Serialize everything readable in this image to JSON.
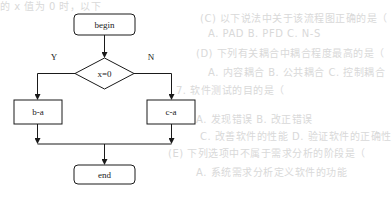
{
  "background_bleed_text": [
    {
      "text": "的 x 值为 0 时，以下",
      "x": 0,
      "y": -2
    },
    {
      "text": "(C) 以下说法中关于该流程图正确的是（",
      "x": 200,
      "y": 10
    },
    {
      "text": "A. PAD        B. PFD        C. N-S",
      "x": 208,
      "y": 28
    },
    {
      "text": "(D) 下列有关耦合中耦合程度最高的是（",
      "x": 196,
      "y": 45
    },
    {
      "text": "A. 内容耦合        B. 公共耦合    C. 控制耦合",
      "x": 208,
      "y": 64
    },
    {
      "text": "7. 软件测试的目的是（",
      "x": 176,
      "y": 82
    },
    {
      "text": "A. 发现错误              B. 改正错误",
      "x": 196,
      "y": 111
    },
    {
      "text": "C. 改善软件的性能              D. 验证软件的正确性",
      "x": 200,
      "y": 128
    },
    {
      "text": "(E) 下列选项中不属于需求分析的阶段是（",
      "x": 168,
      "y": 145
    },
    {
      "text": "A. 系统需求分析定义软件的功能",
      "x": 196,
      "y": 164
    }
  ],
  "flowchart": {
    "start": {
      "label": "begin"
    },
    "decision": {
      "label": "x=0"
    },
    "yes_label": "Y",
    "no_label": "N",
    "yes_process": {
      "label": "b-a"
    },
    "no_process": {
      "label": "c-a"
    },
    "end": {
      "label": "end"
    }
  },
  "colors": {
    "stroke": "#1a1a1a",
    "text": "#222222",
    "bleed": "#d9d9d9",
    "background": "#ffffff"
  }
}
